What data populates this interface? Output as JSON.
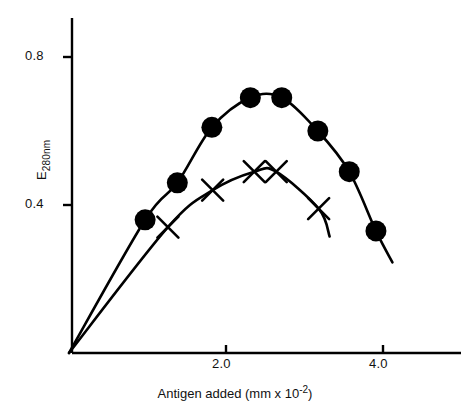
{
  "chart_data": {
    "type": "line",
    "title": "",
    "subtitle": "",
    "xlabel_text": "Antigen added (mm x 10",
    "xlabel_exponent": "-2",
    "xlabel_tail": ")",
    "xlabel_full": "Antigen added (mm x 10-2)",
    "ylabel_prefix": "E",
    "ylabel_subscript": "280nm",
    "ylabel_full": "E280nm",
    "xlim": [
      0,
      5.05
    ],
    "ylim": [
      0,
      0.955
    ],
    "grid": false,
    "legend": "none",
    "xticks": [
      2.0,
      4.0
    ],
    "xtick_labels": [
      "2.0",
      "4.0"
    ],
    "yticks": [
      0.4,
      0.8
    ],
    "ytick_labels": [
      "0.4",
      "0.8"
    ],
    "series": [
      {
        "name": "filled-circle-series",
        "marker": "filled-circle",
        "x": [
          0.97,
          1.38,
          1.82,
          2.31,
          2.71,
          3.17,
          3.57,
          3.91
        ],
        "values": [
          0.36,
          0.46,
          0.61,
          0.69,
          0.69,
          0.6,
          0.49,
          0.33
        ],
        "origin_x": 0.0,
        "origin_y": 0.0,
        "tail_x": 4.12,
        "tail_y": 0.245
      },
      {
        "name": "cross-series",
        "marker": "cross",
        "x": [
          1.26,
          1.83,
          2.36,
          2.64,
          3.18
        ],
        "values": [
          0.34,
          0.44,
          0.49,
          0.49,
          0.39
        ],
        "origin_x": 0.0,
        "origin_y": 0.0,
        "tail_x": 3.32,
        "tail_y": 0.315
      }
    ]
  },
  "axes": {
    "y_tick_high": "0.8",
    "y_tick_low": "0.4",
    "x_tick_mid": "2.0",
    "x_tick_high": "4.0"
  }
}
